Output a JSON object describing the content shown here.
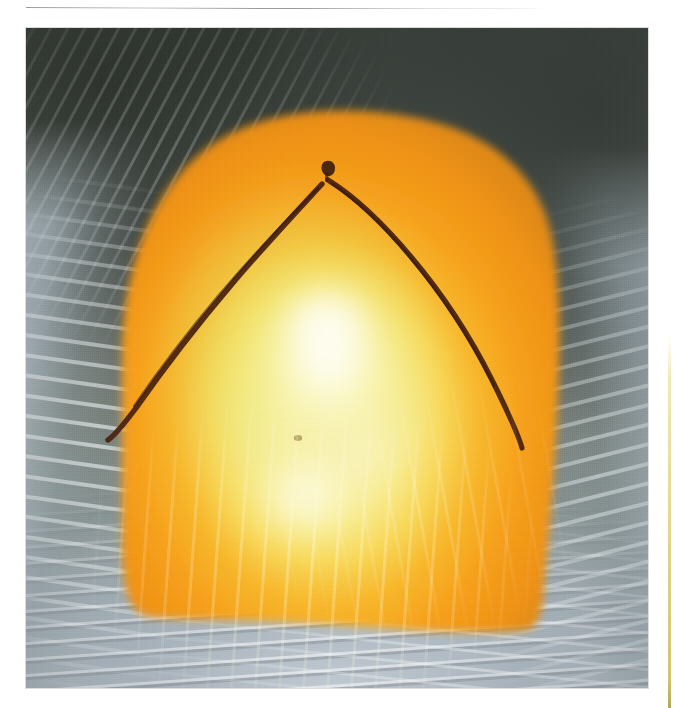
{
  "page": {
    "background_color": "#ffffff",
    "width": 674,
    "height": 708
  },
  "top_rule": {
    "name": "horizontal-rule",
    "color": "#78787d"
  },
  "right_margin_sliver": {
    "name": "adjacent-figure-edge",
    "color": "#d6c860"
  },
  "figure": {
    "type": "clinical-photograph",
    "frame": {
      "x": 26,
      "y": 28,
      "width": 622,
      "height": 660
    },
    "regions": [
      {
        "name": "surgical-drape-upper-left",
        "description": "dark slate-green fenestrated drape with radiating fan folds",
        "color": "#4e554d"
      },
      {
        "name": "surgical-drape-upper-right",
        "description": "dark slate-green drape with soft creases",
        "color": "#565d55"
      },
      {
        "name": "surgical-drape-left",
        "description": "pale blue-grey plastic drape with vertical wrinkle highlights",
        "color": "#bac6ce"
      },
      {
        "name": "surgical-drape-right",
        "description": "pale blue-grey plastic drape, vertical folds",
        "color": "#b0bcc6"
      },
      {
        "name": "surgical-drape-bottom",
        "description": "light grey-blue drape with dense horizontal wrinkle striations",
        "color": "#b4bec3"
      },
      {
        "name": "prepped-skin-field",
        "description": "betadine / povidone-iodine painted chest-abdominal wall, domed",
        "color": "#f39b1c"
      },
      {
        "name": "specular-highlight",
        "description": "bright overhead operating-light reflection, pale yellow-green core",
        "color": "#fdfce4"
      }
    ],
    "markings": [
      {
        "name": "surgical-marking-chevron",
        "description": "inverted-V (chevron) skin incision line drawn in dark surgical marker",
        "color": "#4a2112",
        "apex": {
          "x": 303,
          "y": 181
        },
        "left_end": {
          "x": 108,
          "y": 436
        },
        "right_end": {
          "x": 509,
          "y": 437
        }
      },
      {
        "name": "surgical-marking-apex-dot",
        "description": "small dark tick mark just above the chevron apex",
        "color": "#3d1c10"
      },
      {
        "name": "surgical-marking-midline-dot",
        "description": "faint dark dot low on the midline of the prepped field",
        "color": "#6a4a22"
      }
    ]
  }
}
